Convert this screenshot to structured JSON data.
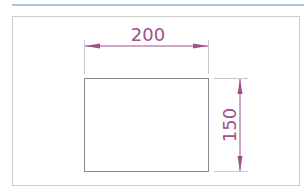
{
  "drawing": {
    "title": "Rectangle dimension drawing",
    "width_label": "200",
    "height_label": "150",
    "colors": {
      "header_rule": "#8fb2d6",
      "frame": "#c8c8c8",
      "shape": "#8a8a8a",
      "dimension": "#a0508a"
    }
  }
}
